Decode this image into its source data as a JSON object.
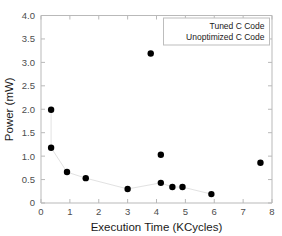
{
  "figure": {
    "clipped_top_text": "",
    "background": "#ffffff",
    "marker_color": "#000000",
    "axis_color": "#b9b9b9",
    "connector_color": "#e2e2e2"
  },
  "axes": {
    "xlabel": "Execution Time (KCycles)",
    "ylabel": "Power (mW)",
    "xticks": [
      "0",
      "1",
      "2",
      "3",
      "4",
      "5",
      "6",
      "7",
      "8"
    ],
    "yticks": [
      "0",
      "0.5",
      "1.0",
      "1.5",
      "2.0",
      "2.5",
      "3.0",
      "3.5",
      "4.0"
    ]
  },
  "legend": {
    "position": "top-right",
    "entries": [
      {
        "label": "Tuned C Code"
      },
      {
        "label": "Unoptimized C Code"
      }
    ]
  },
  "chart_data": {
    "type": "scatter",
    "title": "",
    "xlabel": "Execution Time (KCycles)",
    "ylabel": "Power (mW)",
    "xlim": [
      0,
      8
    ],
    "ylim": [
      0,
      4.0
    ],
    "xticks": [
      0,
      1,
      2,
      3,
      4,
      5,
      6,
      7,
      8
    ],
    "yticks": [
      0,
      0.5,
      1.0,
      1.5,
      2.0,
      2.5,
      3.0,
      3.5,
      4.0
    ],
    "grid": false,
    "legend": [
      "Tuned C Code",
      "Unoptimized C Code"
    ],
    "series": [
      {
        "name": "Tuned C Code",
        "marker": "circle",
        "color": "#000000",
        "connected": true,
        "points": [
          {
            "x": 0.35,
            "y": 1.99
          },
          {
            "x": 0.35,
            "y": 1.18
          },
          {
            "x": 0.9,
            "y": 0.66
          },
          {
            "x": 1.55,
            "y": 0.53
          },
          {
            "x": 3.0,
            "y": 0.3
          },
          {
            "x": 4.15,
            "y": 0.43
          },
          {
            "x": 4.55,
            "y": 0.34
          },
          {
            "x": 4.9,
            "y": 0.34
          },
          {
            "x": 5.9,
            "y": 0.19
          }
        ]
      },
      {
        "name": "Unoptimized C Code",
        "marker": "circle",
        "color": "#000000",
        "connected": false,
        "points": [
          {
            "x": 3.8,
            "y": 3.19
          },
          {
            "x": 4.15,
            "y": 1.03
          },
          {
            "x": 7.6,
            "y": 0.86
          }
        ]
      }
    ]
  }
}
